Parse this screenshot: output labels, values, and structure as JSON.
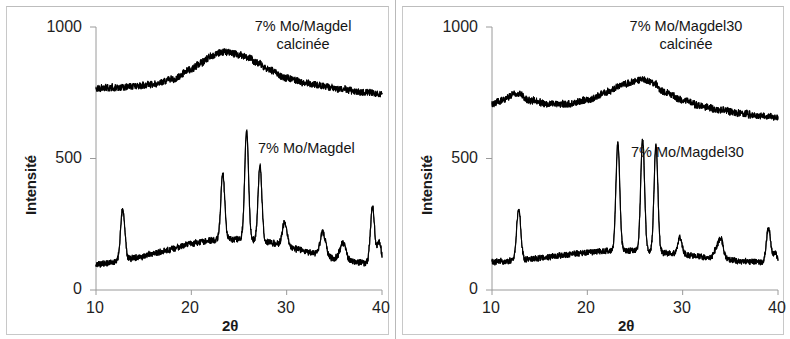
{
  "figure": {
    "panels": [
      {
        "id": "left",
        "axes": {
          "ylabel": "Intensité",
          "xlabel": "2θ",
          "ytick_labels": [
            "1000",
            "500",
            "0"
          ],
          "ytick_values": [
            1000,
            500,
            0
          ],
          "xtick_labels": [
            "10",
            "20",
            "30",
            "40"
          ],
          "xtick_values": [
            10,
            20,
            30,
            40
          ]
        },
        "annotations": [
          {
            "name": "upper-series-label",
            "lines": [
              "7% Mo/Magdel",
              "calcinée"
            ]
          },
          {
            "name": "lower-series-label",
            "lines": [
              "7% Mo/Magdel"
            ]
          }
        ]
      },
      {
        "id": "right",
        "axes": {
          "ylabel": "Intensité",
          "xlabel": "2θ",
          "ytick_labels": [
            "1000",
            "500",
            "0"
          ],
          "ytick_values": [
            1000,
            500,
            0
          ],
          "xtick_labels": [
            "10",
            "20",
            "30",
            "40"
          ],
          "xtick_values": [
            10,
            20,
            30,
            40
          ]
        },
        "annotations": [
          {
            "name": "upper-series-label",
            "lines": [
              "7% Mo/Magdel30",
              "calcinée"
            ]
          },
          {
            "name": "lower-series-label",
            "lines": [
              "7% Mo/Magdel30"
            ]
          }
        ]
      }
    ]
  },
  "chart_data": [
    {
      "type": "line",
      "panel": "left",
      "title": "",
      "xlabel": "2θ",
      "ylabel": "Intensité",
      "xlim": [
        10,
        40
      ],
      "ylim": [
        0,
        1000
      ],
      "xticks": [
        10,
        20,
        30,
        40
      ],
      "yticks": [
        0,
        500,
        1000
      ],
      "grid": false,
      "legend": "in-plot annotations",
      "line_color": "#000000",
      "series": [
        {
          "name": "7% Mo/Magdel calcinée",
          "description": "Broad amorphous halo, no sharp reflections",
          "baseline": 765,
          "noise_amplitude": 12,
          "broad_humps": [
            {
              "center": 23.6,
              "height": 145,
              "width": 6.2
            }
          ],
          "peaks": [],
          "x": [
            10,
            12,
            14,
            16,
            18,
            20,
            21,
            22,
            23,
            23.6,
            24,
            25,
            26,
            27,
            28,
            30,
            32,
            34,
            36,
            38,
            40
          ],
          "y": [
            768,
            770,
            774,
            781,
            800,
            840,
            865,
            888,
            902,
            906,
            903,
            895,
            882,
            862,
            840,
            805,
            788,
            775,
            762,
            752,
            746
          ]
        },
        {
          "name": "7% Mo/Magdel",
          "description": "Crystalline peaks on a broad background",
          "baseline": 85,
          "noise_amplitude": 11,
          "broad_humps": [
            {
              "center": 24.5,
              "height": 110,
              "width": 7.0
            }
          ],
          "peaks": [
            {
              "position": 12.8,
              "height": 280,
              "width": 0.22
            },
            {
              "position": 23.3,
              "height": 335,
              "width": 0.2
            },
            {
              "position": 25.8,
              "height": 500,
              "width": 0.2
            },
            {
              "position": 27.2,
              "height": 370,
              "width": 0.2
            },
            {
              "position": 29.8,
              "height": 175,
              "width": 0.25
            },
            {
              "position": 33.8,
              "height": 175,
              "width": 0.28
            },
            {
              "position": 35.9,
              "height": 150,
              "width": 0.3
            },
            {
              "position": 39.0,
              "height": 300,
              "width": 0.22
            },
            {
              "position": 39.7,
              "height": 175,
              "width": 0.22
            }
          ]
        }
      ]
    },
    {
      "type": "line",
      "panel": "right",
      "title": "",
      "xlabel": "2θ",
      "ylabel": "Intensité",
      "xlim": [
        10,
        40
      ],
      "ylim": [
        0,
        1000
      ],
      "xticks": [
        10,
        20,
        30,
        40
      ],
      "yticks": [
        0,
        500,
        1000
      ],
      "grid": false,
      "legend": "in-plot annotations",
      "line_color": "#000000",
      "series": [
        {
          "name": "7% Mo/Magdel30 calcinée",
          "description": "Broad halo with a small shoulder near 12.5°",
          "baseline": 700,
          "noise_amplitude": 12,
          "broad_humps": [
            {
              "center": 12.6,
              "height": 48,
              "width": 1.3
            },
            {
              "center": 26.0,
              "height": 120,
              "width": 5.0
            }
          ],
          "peaks": [],
          "x": [
            10,
            11,
            12.6,
            14,
            16,
            18,
            20,
            22,
            23.5,
            25,
            26,
            27,
            28,
            30,
            32,
            34,
            36,
            38,
            40
          ],
          "y": [
            706,
            722,
            748,
            722,
            706,
            708,
            722,
            752,
            778,
            795,
            800,
            788,
            752,
            722,
            700,
            684,
            672,
            664,
            658
          ]
        },
        {
          "name": "7% Mo/Magdel30",
          "description": "Sharp crystalline reflections on a low background",
          "baseline": 100,
          "noise_amplitude": 10,
          "broad_humps": [
            {
              "center": 24.0,
              "height": 50,
              "width": 7.0
            }
          ],
          "peaks": [
            {
              "position": 12.8,
              "height": 295,
              "width": 0.22
            },
            {
              "position": 23.2,
              "height": 510,
              "width": 0.2
            },
            {
              "position": 25.8,
              "height": 525,
              "width": 0.2
            },
            {
              "position": 27.2,
              "height": 505,
              "width": 0.2
            },
            {
              "position": 29.7,
              "height": 165,
              "width": 0.22
            },
            {
              "position": 33.5,
              "height": 130,
              "width": 0.25
            },
            {
              "position": 34.0,
              "height": 175,
              "width": 0.25
            },
            {
              "position": 36.0,
              "height": 95,
              "width": 0.3
            },
            {
              "position": 39.0,
              "height": 230,
              "width": 0.22
            },
            {
              "position": 39.7,
              "height": 135,
              "width": 0.22
            }
          ]
        }
      ]
    }
  ]
}
